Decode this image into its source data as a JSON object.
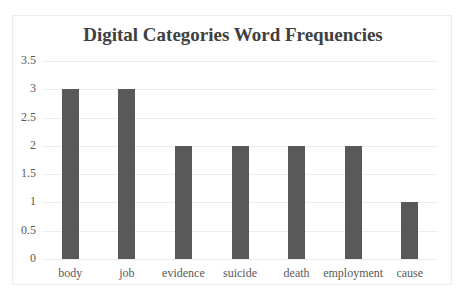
{
  "chart_data": {
    "type": "bar",
    "title": "Digital Categories Word Frequencies",
    "xlabel": "",
    "ylabel": "",
    "categories": [
      "body",
      "job",
      "evidence",
      "suicide",
      "death",
      "employment",
      "cause"
    ],
    "values": [
      3,
      3,
      2,
      2,
      2,
      2,
      1
    ],
    "ylim": [
      0,
      3.5
    ],
    "yticks": [
      "0",
      "0.5",
      "1",
      "1.5",
      "2",
      "2.5",
      "3",
      "3.5"
    ],
    "grid": true,
    "legend": "none",
    "bar_color": "#595959"
  }
}
